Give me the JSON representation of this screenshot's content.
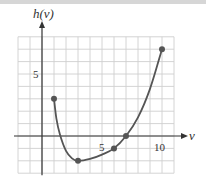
{
  "chart_data": {
    "type": "line",
    "title": "",
    "xlabel": "v",
    "ylabel": "h(v)",
    "x_ticks_labeled": [
      5,
      10
    ],
    "y_ticks_labeled": [
      5
    ],
    "xlim": [
      -2,
      11
    ],
    "ylim": [
      -3,
      8
    ],
    "grid": true,
    "grid_step": 1,
    "legend": null,
    "series": [
      {
        "name": "h(v)",
        "marked_points": [
          {
            "x": 1,
            "y": 3
          },
          {
            "x": 3,
            "y": -2
          },
          {
            "x": 6,
            "y": -1
          },
          {
            "x": 7,
            "y": 0
          },
          {
            "x": 10,
            "y": 7
          }
        ],
        "curve": [
          [
            1,
            3
          ],
          [
            1.2,
            1.4
          ],
          [
            1.5,
            0.1
          ],
          [
            2,
            -1.2
          ],
          [
            2.5,
            -1.8
          ],
          [
            3,
            -2
          ],
          [
            4,
            -1.85
          ],
          [
            5,
            -1.5
          ],
          [
            6,
            -1
          ],
          [
            7,
            0
          ],
          [
            8,
            1.5
          ],
          [
            9,
            3.8
          ],
          [
            10,
            7
          ]
        ]
      }
    ],
    "colors": {
      "curve": "#555555",
      "grid": "#cfcfcf",
      "axis": "#333333"
    }
  },
  "labels": {
    "y_axis": "h(v)",
    "x_axis": "v",
    "tick_x_5": "5",
    "tick_x_10": "10",
    "tick_y_5": "5"
  }
}
